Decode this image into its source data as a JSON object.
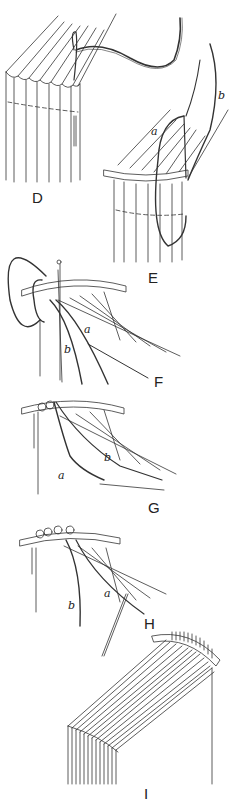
{
  "figure": {
    "stroke_color": "#333333",
    "background": "#ffffff",
    "panels": [
      {
        "id": "D",
        "label": "D",
        "threads": []
      },
      {
        "id": "E",
        "label": "E",
        "threads": [
          "a",
          "b"
        ]
      },
      {
        "id": "F",
        "label": "F",
        "threads": [
          "a",
          "b"
        ]
      },
      {
        "id": "G",
        "label": "G",
        "threads": [
          "a",
          "b"
        ]
      },
      {
        "id": "H",
        "label": "H",
        "threads": [
          "a",
          "b"
        ]
      },
      {
        "id": "I",
        "label": "I",
        "threads": []
      }
    ]
  }
}
